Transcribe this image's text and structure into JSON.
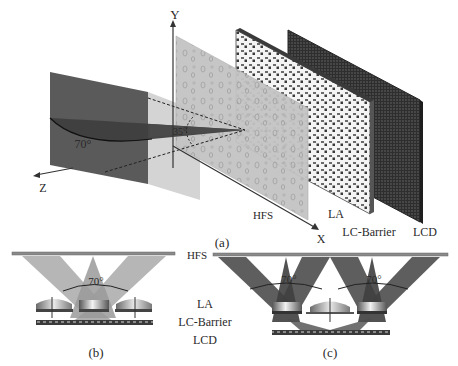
{
  "figure": {
    "panel_a": {
      "caption": "(a)",
      "axes": {
        "y_label": "Y",
        "x_label": "X",
        "z_label": "Z"
      },
      "angle_wide": "70°",
      "angle_narrow": "35°",
      "layers": {
        "hfs": "HFS",
        "la": "LA",
        "lc_barrier": "LC-Barrier",
        "lcd": "LCD"
      }
    },
    "panel_b": {
      "caption": "(b)",
      "angle": "70°"
    },
    "panel_c": {
      "caption": "(c)",
      "angle_left": "70°",
      "angle_right": "70°"
    },
    "side_labels": {
      "hfs": "HFS",
      "la": "LA",
      "lc_barrier": "LC-Barrier",
      "lcd": "LCD"
    },
    "colors": {
      "dark_box": "#5a5a5a",
      "light_box": "#c8c8c8",
      "hfs_panel": "#bdbdbd",
      "lcd_panel": "#3a3a3a",
      "beam_light": "#a9a9a9",
      "beam_dark": "#4d4d4d"
    }
  }
}
